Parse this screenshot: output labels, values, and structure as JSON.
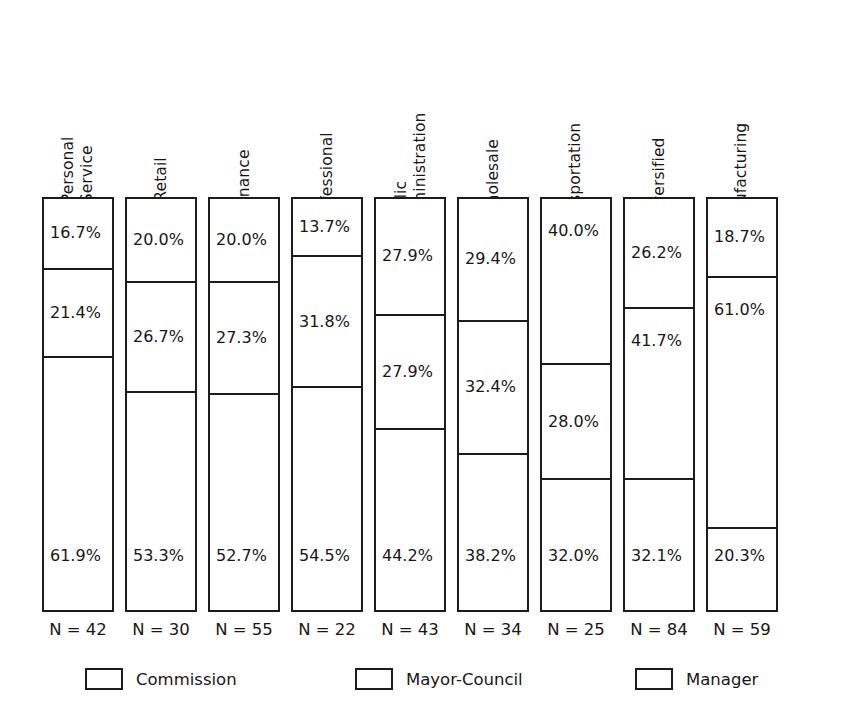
{
  "chart_data": {
    "type": "bar",
    "subtype": "100-percent-stacked-vertical",
    "title": "",
    "subtitle": "",
    "xlabel": "",
    "ylabel": "",
    "ylim": [
      0,
      100
    ],
    "grid": false,
    "legend_position": "bottom",
    "value_suffix": "%",
    "categories": [
      "Personal Service",
      "Retail",
      "Finance",
      "Professional",
      "Public Administration",
      "Wholesale",
      "Transportation",
      "Diversified",
      "Manufacturing"
    ],
    "series": [
      {
        "name": "Manager",
        "stack_order": 0,
        "values": [
          16.7,
          20.0,
          20.0,
          13.7,
          27.9,
          29.4,
          40.0,
          26.2,
          18.7
        ]
      },
      {
        "name": "Mayor-Council",
        "stack_order": 1,
        "values": [
          21.4,
          26.7,
          27.3,
          31.8,
          27.9,
          32.4,
          28.0,
          41.7,
          61.0
        ]
      },
      {
        "name": "Commission",
        "stack_order": 2,
        "values": [
          61.9,
          53.3,
          52.7,
          54.5,
          44.2,
          38.2,
          32.0,
          32.1,
          20.3
        ]
      }
    ],
    "sample_sizes": [
      42,
      30,
      55,
      22,
      43,
      34,
      25,
      84,
      59
    ],
    "sample_size_labels": [
      "N = 42",
      "N = 30",
      "N = 55",
      "N = 22",
      "N = 43",
      "N = 34",
      "N = 25",
      "N = 84",
      "N = 59"
    ]
  },
  "columns": [
    {
      "label_line1": "Personal",
      "label_line2": "Service",
      "n_label": "N = 42",
      "segments": [
        {
          "label": "16.7%",
          "value": 16.7
        },
        {
          "label": "21.4%",
          "value": 21.4
        },
        {
          "label": "61.9%",
          "value": 61.9
        }
      ]
    },
    {
      "label_line1": "Retail",
      "label_line2": "",
      "n_label": "N = 30",
      "segments": [
        {
          "label": "20.0%",
          "value": 20.0
        },
        {
          "label": "26.7%",
          "value": 26.7
        },
        {
          "label": "53.3%",
          "value": 53.3
        }
      ]
    },
    {
      "label_line1": "Finance",
      "label_line2": "",
      "n_label": "N = 55",
      "segments": [
        {
          "label": "20.0%",
          "value": 20.0
        },
        {
          "label": "27.3%",
          "value": 27.3
        },
        {
          "label": "52.7%",
          "value": 52.7
        }
      ]
    },
    {
      "label_line1": "Professional",
      "label_line2": "",
      "n_label": "N = 22",
      "segments": [
        {
          "label": "13.7%",
          "value": 13.7
        },
        {
          "label": "31.8%",
          "value": 31.8
        },
        {
          "label": "54.5%",
          "value": 54.5
        }
      ]
    },
    {
      "label_line1": "Public",
      "label_line2": "Administration",
      "n_label": "N = 43",
      "segments": [
        {
          "label": "27.9%",
          "value": 27.9
        },
        {
          "label": "27.9%",
          "value": 27.9
        },
        {
          "label": "44.2%",
          "value": 44.2
        }
      ]
    },
    {
      "label_line1": "Wholesale",
      "label_line2": "",
      "n_label": "N = 34",
      "segments": [
        {
          "label": "29.4%",
          "value": 29.4
        },
        {
          "label": "32.4%",
          "value": 32.4
        },
        {
          "label": "38.2%",
          "value": 38.2
        }
      ]
    },
    {
      "label_line1": "Transportation",
      "label_line2": "",
      "n_label": "N = 25",
      "segments": [
        {
          "label": "40.0%",
          "value": 40.0
        },
        {
          "label": "28.0%",
          "value": 28.0
        },
        {
          "label": "32.0%",
          "value": 32.0
        }
      ]
    },
    {
      "label_line1": "Diversified",
      "label_line2": "",
      "n_label": "N = 84",
      "segments": [
        {
          "label": "26.2%",
          "value": 26.2
        },
        {
          "label": "41.7%",
          "value": 41.7
        },
        {
          "label": "32.1%",
          "value": 32.1
        }
      ]
    },
    {
      "label_line1": "Manufacturing",
      "label_line2": "",
      "n_label": "N = 59",
      "segments": [
        {
          "label": "18.7%",
          "value": 18.7
        },
        {
          "label": "61.0%",
          "value": 61.0
        },
        {
          "label": "20.3%",
          "value": 20.3
        }
      ]
    }
  ],
  "legend": {
    "items": [
      {
        "label": "Commission",
        "x": 85
      },
      {
        "label": "Mayor-Council",
        "x": 355
      },
      {
        "label": "Manager",
        "x": 635
      }
    ]
  },
  "layout": {
    "bar_left_start": 42,
    "bar_pitch": 83,
    "bar_width": 72,
    "bar_top": 197,
    "bar_height": 415,
    "n_label_top": 620
  },
  "colors": {
    "ink": "#1c1c1c",
    "fill": "#ffffff",
    "background": "#ffffff"
  }
}
